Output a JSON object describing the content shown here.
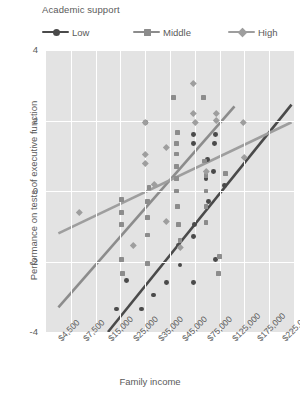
{
  "legend": {
    "title": "Academic support",
    "items": [
      {
        "label": "Low",
        "color": "#4a4a4a",
        "marker": "circle"
      },
      {
        "label": "Middle",
        "color": "#8c8c8c",
        "marker": "square"
      },
      {
        "label": "High",
        "color": "#9e9e9e",
        "marker": "diamond"
      }
    ]
  },
  "chart_data": {
    "type": "scatter",
    "title": "",
    "xlabel": "Family income",
    "ylabel": "Performance on tests of executive function",
    "grid": true,
    "legend_position": "top",
    "plot_background": "#e3e3e3",
    "ylim": [
      -4,
      4
    ],
    "yticks": [
      4,
      2,
      0,
      -2,
      -4
    ],
    "ytick_labels": [
      "4",
      "2",
      "0",
      "-2",
      "-4"
    ],
    "xticks": [
      0,
      1,
      2,
      3,
      4,
      5,
      6,
      7,
      8,
      9
    ],
    "xtick_labels": [
      "$4,500",
      "$7,500",
      "$15,000",
      "$25,000",
      "$35,000",
      "$45,000",
      "$75,000",
      "$125,000",
      "$175,000",
      "$225,000"
    ],
    "series": [
      {
        "name": "Low",
        "marker": "circle",
        "color": "#4a4a4a",
        "trend": {
          "x0": 2.0,
          "y0": -4.0,
          "x1": 9.4,
          "y1": 2.45
        },
        "points": [
          {
            "x": 2.35,
            "y": -3.35
          },
          {
            "x": 3.35,
            "y": -3.35
          },
          {
            "x": 2.75,
            "y": -2.55
          },
          {
            "x": 3.85,
            "y": -2.95
          },
          {
            "x": 4.35,
            "y": -2.6
          },
          {
            "x": 4.9,
            "y": -2.1
          },
          {
            "x": 5.45,
            "y": -2.6
          },
          {
            "x": 4.85,
            "y": -1.55
          },
          {
            "x": 5.45,
            "y": -1.3
          },
          {
            "x": 5.5,
            "y": -0.95
          },
          {
            "x": 6.35,
            "y": -1.95
          },
          {
            "x": 6.05,
            "y": -0.3
          },
          {
            "x": 5.95,
            "y": 0.35
          },
          {
            "x": 6.0,
            "y": 0.9
          },
          {
            "x": 5.45,
            "y": 1.35
          },
          {
            "x": 5.45,
            "y": 1.6
          },
          {
            "x": 6.3,
            "y": 1.35
          },
          {
            "x": 6.35,
            "y": 1.6
          },
          {
            "x": 3.5,
            "y": 1.95
          },
          {
            "x": 6.25,
            "y": 0.55
          },
          {
            "x": 6.7,
            "y": 0.15
          }
        ]
      },
      {
        "name": "Middle",
        "marker": "square",
        "color": "#8c8c8c",
        "trend": {
          "x0": 0.0,
          "y0": -3.3,
          "x1": 7.1,
          "y1": 2.4
        },
        "points": [
          {
            "x": 2.55,
            "y": -0.95
          },
          {
            "x": 2.55,
            "y": -0.6
          },
          {
            "x": 2.55,
            "y": -0.25
          },
          {
            "x": 2.55,
            "y": -1.95
          },
          {
            "x": 2.6,
            "y": -2.35
          },
          {
            "x": 3.6,
            "y": -2.05
          },
          {
            "x": 3.6,
            "y": -1.25
          },
          {
            "x": 3.6,
            "y": -0.75
          },
          {
            "x": 3.6,
            "y": -0.3
          },
          {
            "x": 3.65,
            "y": 0.1
          },
          {
            "x": 4.75,
            "y": 0.0
          },
          {
            "x": 4.75,
            "y": 0.35
          },
          {
            "x": 4.75,
            "y": 0.7
          },
          {
            "x": 4.75,
            "y": 1.05
          },
          {
            "x": 4.75,
            "y": 1.35
          },
          {
            "x": 4.8,
            "y": 1.65
          },
          {
            "x": 4.8,
            "y": -0.45
          },
          {
            "x": 4.85,
            "y": -0.95
          },
          {
            "x": 4.9,
            "y": -1.4
          },
          {
            "x": 4.65,
            "y": 2.65
          },
          {
            "x": 5.85,
            "y": 2.65
          },
          {
            "x": 5.95,
            "y": -0.9
          },
          {
            "x": 5.95,
            "y": -0.45
          },
          {
            "x": 5.95,
            "y": 0.0
          },
          {
            "x": 5.95,
            "y": 0.45
          },
          {
            "x": 5.9,
            "y": 0.85
          },
          {
            "x": 6.75,
            "y": 0.5
          },
          {
            "x": 6.45,
            "y": -2.35
          },
          {
            "x": 6.5,
            "y": -1.85
          }
        ]
      },
      {
        "name": "High",
        "marker": "diamond",
        "color": "#9e9e9e",
        "trend": {
          "x0": 0.0,
          "y0": -1.2,
          "x1": 9.4,
          "y1": 1.95
        },
        "points": [
          {
            "x": 0.85,
            "y": -0.6
          },
          {
            "x": 3.5,
            "y": 1.95
          },
          {
            "x": 3.5,
            "y": 1.05
          },
          {
            "x": 3.5,
            "y": 0.8
          },
          {
            "x": 4.35,
            "y": 1.25
          },
          {
            "x": 4.35,
            "y": -0.85
          },
          {
            "x": 3.85,
            "y": 0.2
          },
          {
            "x": 3.0,
            "y": -1.55
          },
          {
            "x": 5.45,
            "y": 3.05
          },
          {
            "x": 5.5,
            "y": 1.95
          },
          {
            "x": 5.45,
            "y": 2.2
          },
          {
            "x": 6.35,
            "y": 2.0
          },
          {
            "x": 6.35,
            "y": 2.2
          },
          {
            "x": 7.45,
            "y": 1.95
          },
          {
            "x": 7.5,
            "y": 0.95
          },
          {
            "x": 5.95,
            "y": 0.55
          },
          {
            "x": 4.9,
            "y": -1.6
          }
        ]
      }
    ]
  }
}
